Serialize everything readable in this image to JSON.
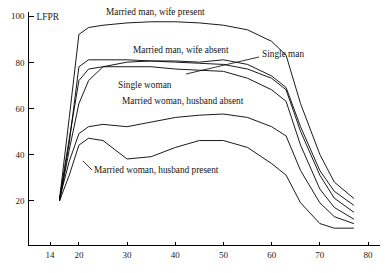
{
  "chart_data": {
    "type": "line",
    "title": "",
    "subtitle": "",
    "xlabel": "",
    "ylabel": "LFPR",
    "xlim": [
      12,
      80
    ],
    "ylim": [
      0,
      100
    ],
    "grid": false,
    "legend_position": "inline-annotations",
    "y_ticks": [
      20,
      40,
      60,
      80,
      100
    ],
    "x_ticks": [
      14,
      20,
      30,
      40,
      50,
      60,
      70,
      80
    ],
    "y_tick_labels": [
      "20",
      "40",
      "60",
      "80",
      "100"
    ],
    "x_tick_labels": [
      "14",
      "20",
      "30",
      "40",
      "50",
      "60",
      "70",
      "80"
    ],
    "series": [
      {
        "name": "Married man, wife present",
        "label": "Married man, wife present",
        "label_x": 106,
        "label_y": 15,
        "leader": null,
        "x": [
          16,
          18,
          20,
          22,
          25,
          30,
          35,
          40,
          45,
          50,
          55,
          60,
          63,
          66,
          70,
          73,
          77
        ],
        "values": [
          21,
          56,
          92,
          95,
          96,
          97,
          97.5,
          97.5,
          97,
          96,
          94,
          89,
          83,
          62,
          40,
          28,
          21
        ]
      },
      {
        "name": "Married man, wife absent",
        "label": "Married man, wife absent",
        "label_x": 133,
        "label_y": 53,
        "leader": null,
        "x": [
          16,
          18,
          20,
          22,
          25,
          30,
          35,
          40,
          45,
          50,
          55,
          60,
          63,
          66,
          70,
          73,
          77
        ],
        "values": [
          20,
          45,
          78,
          81,
          81,
          81,
          80.5,
          80,
          79.5,
          79,
          77,
          73,
          68,
          50,
          31,
          21,
          15
        ]
      },
      {
        "name": "Single man",
        "label": "Single man",
        "label_x": 262,
        "label_y": 57,
        "leader": {
          "x1": 259,
          "y1": 57,
          "x2": 186,
          "y2": 74
        },
        "x": [
          16,
          18,
          20,
          22,
          25,
          30,
          35,
          40,
          45,
          50,
          55,
          60,
          63,
          66,
          70,
          73,
          77
        ],
        "values": [
          20,
          42,
          62,
          72,
          78,
          80,
          80.5,
          80.5,
          80,
          81,
          79,
          74,
          69,
          52,
          33,
          24,
          18
        ]
      },
      {
        "name": "Single woman",
        "label": "Single woman",
        "label_x": 118,
        "label_y": 88,
        "leader": null,
        "x": [
          16,
          18,
          20,
          22,
          25,
          30,
          35,
          40,
          45,
          50,
          55,
          60,
          63,
          66,
          70,
          73,
          77
        ],
        "values": [
          21,
          47,
          72,
          77,
          78,
          78,
          78,
          77,
          76.5,
          76,
          73,
          68,
          63,
          44,
          25,
          17,
          12
        ]
      },
      {
        "name": "Married woman, husband absent",
        "label": "Married woman, husband absent",
        "label_x": 122,
        "label_y": 104,
        "leader": null,
        "x": [
          16,
          18,
          20,
          22,
          25,
          30,
          35,
          40,
          45,
          50,
          55,
          60,
          63,
          66,
          70,
          73,
          77
        ],
        "values": [
          21,
          37,
          49,
          52,
          53,
          52,
          54,
          56,
          57,
          57.5,
          56,
          52,
          48,
          33,
          19,
          13,
          10
        ]
      },
      {
        "name": "Married woman, husband present",
        "label": "Married woman, husband present",
        "label_x": 94,
        "label_y": 173,
        "leader": {
          "x1": 92,
          "y1": 170,
          "x2": 83,
          "y2": 161
        },
        "x": [
          16,
          18,
          20,
          22,
          25,
          30,
          35,
          40,
          45,
          50,
          55,
          60,
          63,
          66,
          70,
          73,
          77
        ],
        "values": [
          20,
          31,
          44,
          47,
          46,
          38,
          39,
          43,
          46,
          46,
          43,
          36,
          31,
          19,
          10,
          8,
          8
        ]
      }
    ]
  }
}
